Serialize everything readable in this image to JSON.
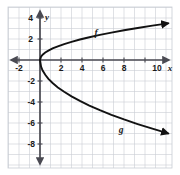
{
  "figure": {
    "title": "",
    "background_color": "#ffffff",
    "grid_color": "#c9cdd4",
    "axis_color": "#4a4a52",
    "curve_color": "#121212",
    "plot_border_color": "#c9cdd4"
  },
  "axes": {
    "x_axis_label": "x",
    "y_axis_label": "y",
    "x_tick_labels": [
      "-2",
      "2",
      "4",
      "6",
      "8",
      "10"
    ],
    "y_tick_labels": [
      "4",
      "2",
      "-2",
      "-4",
      "-6",
      "-8"
    ],
    "x_range": [
      -3,
      12.5
    ],
    "y_range": [
      -9.2,
      5.2
    ],
    "grid": true,
    "grid_step": 1,
    "tick_step": 2
  },
  "curve_labels": {
    "upper": "f",
    "lower": "g"
  },
  "chart_data": {
    "type": "line",
    "title": "",
    "xlabel": "x",
    "ylabel": "y",
    "xlim": [
      -3,
      12.5
    ],
    "ylim": [
      -9.2,
      5.2
    ],
    "grid": true,
    "legend": "none",
    "annotations": [
      {
        "text": "f",
        "x": 5.4,
        "y": 2.55
      },
      {
        "text": "g",
        "x": 7.7,
        "y": -5.0
      }
    ],
    "xticks": [
      -2,
      2,
      4,
      6,
      8,
      10
    ],
    "yticks": [
      4,
      2,
      -2,
      -4,
      -6,
      -8
    ],
    "series": [
      {
        "name": "f",
        "equation": "y = sqrt(x)",
        "arrow_end": true,
        "x": [
          0,
          0.1,
          0.25,
          0.5,
          0.8,
          1.2,
          1.7,
          2.3,
          3.0,
          3.8,
          4.7,
          5.7,
          6.8,
          8.0,
          9.3,
          10.7,
          12.2
        ],
        "y": [
          0,
          0.32,
          0.5,
          0.71,
          0.89,
          1.1,
          1.3,
          1.52,
          1.73,
          1.95,
          2.17,
          2.39,
          2.61,
          2.83,
          3.05,
          3.27,
          3.49
        ]
      },
      {
        "name": "g",
        "equation": "y = -2*sqrt(x)",
        "arrow_end": true,
        "x": [
          0,
          0.1,
          0.25,
          0.5,
          0.8,
          1.2,
          1.7,
          2.3,
          3.0,
          3.8,
          4.7,
          5.7,
          6.8,
          8.0,
          9.3,
          10.7,
          12.2
        ],
        "y": [
          0,
          -0.63,
          -1.0,
          -1.41,
          -1.79,
          -2.19,
          -2.61,
          -3.03,
          -3.46,
          -3.9,
          -4.34,
          -4.78,
          -5.22,
          -5.66,
          -6.1,
          -6.54,
          -6.99
        ]
      }
    ]
  }
}
